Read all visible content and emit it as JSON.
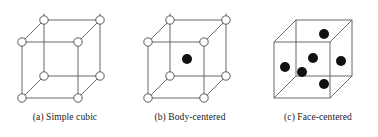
{
  "figure": {
    "type": "crystal-lattice-diagram",
    "background_color": "#ffffff",
    "edge_color": "#5a5a5a",
    "open_circle_fill": "#ffffff",
    "open_circle_stroke": "#4a4a4a",
    "filled_circle_color": "#111111",
    "panel_count": 3
  },
  "panels": [
    {
      "id": "a",
      "caption": "(a) Simple cubic",
      "structure_name": "Simple cubic",
      "corner_atom_count": 8,
      "interior_atom_count": 0,
      "face_atom_count": 0,
      "atom_style": "open-circle"
    },
    {
      "id": "b",
      "caption": "(b) Body-centered",
      "structure_name": "Body-centered",
      "corner_atom_count": 8,
      "interior_atom_count": 1,
      "face_atom_count": 0,
      "atom_style": "open-circle-corners-filled-center"
    },
    {
      "id": "c",
      "caption": "(c) Face-centered",
      "structure_name": "Face-centered",
      "corner_atom_count": 0,
      "interior_atom_count": 0,
      "face_atom_count": 5,
      "atom_style": "filled-circle"
    }
  ],
  "geometry": {
    "front_face": {
      "left": 22,
      "top": 22,
      "size": 56
    },
    "depth_offset": {
      "dx": 22,
      "dy": -22
    },
    "open_circle_radius": 4.2,
    "filled_circle_radius": 5.0
  }
}
